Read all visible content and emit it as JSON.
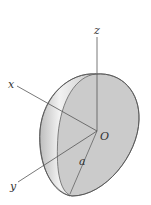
{
  "diagram": {
    "axes": {
      "x": "x",
      "y": "y",
      "z": "z"
    },
    "origin_label": "O",
    "radius_label": "a"
  },
  "colors": {
    "background": "#ffffff",
    "surface": "#cccccc",
    "face": "#c8c8c8",
    "highlight": "#eeeeee",
    "outline": "#666666",
    "axis": "#555555"
  }
}
